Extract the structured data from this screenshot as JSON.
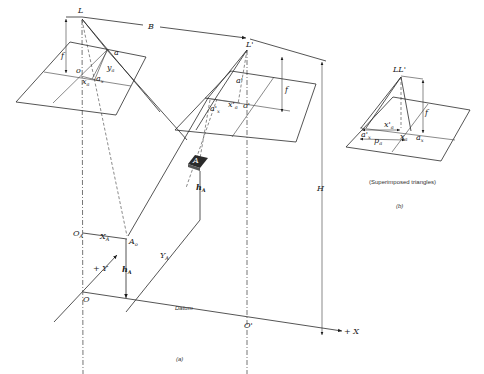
{
  "figure": {
    "panel_a": {
      "caption": "(a)",
      "left_exposure": {
        "station_label": "L",
        "focal_label": "f",
        "principal_point_label": "o",
        "image_point_label": "a",
        "x_coord_label": "x",
        "x_coord_sub": "a",
        "y_coord_label": "y",
        "y_coord_sub": "a",
        "a_x_label": "a",
        "a_x_sub": "x"
      },
      "right_exposure": {
        "station_label": "L'",
        "focal_label": "f",
        "principal_point_label": "o'",
        "image_point_label": "a'",
        "x_coord_label": "x'",
        "x_coord_sub": "a",
        "a_x_label": "a'",
        "a_x_sub": "x"
      },
      "air_base_label": "B",
      "flying_height_label": "H",
      "object_point_label": "A",
      "elevation_label": "h",
      "elevation_sub": "A",
      "ground_origin_label": "O",
      "ground_origin_sub": "A",
      "ground_point_label": "A",
      "ground_point_sub": "o",
      "X_coord_label": "X",
      "X_coord_sub": "A",
      "Y_coord_label": "Y",
      "Y_coord_sub": "A",
      "datum_label": "Datum",
      "origin_label": "O",
      "origin_prime_label": "O'",
      "plus_x_label": "+ X",
      "plus_y_label": "+ Y"
    },
    "panel_b": {
      "caption": "(b)",
      "title": "(Superimposed triangles)",
      "station_label": "LL'",
      "focal_label": "f",
      "x_prime_label": "x'",
      "x_prime_sub": "a",
      "x_label": "x",
      "x_sub": "a",
      "a_x_label": "a",
      "a_x_sub": "x",
      "a_x_prime_label": "a'",
      "a_x_prime_sub": "x",
      "parallax_label": "p",
      "parallax_sub": "a"
    }
  }
}
